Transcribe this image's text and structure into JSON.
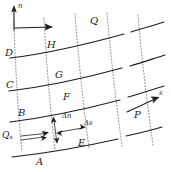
{
  "figure": {
    "type": "hand-drawn-diagram",
    "background_color": "#ffffff",
    "ink_color": "#1f1f1f",
    "dotted_line_color": "#6e6e6e"
  },
  "axes": {
    "normal_axis_label": "n",
    "streamwise_axis_label": "s"
  },
  "nodes": {
    "a": "A",
    "b": "B",
    "c": "C",
    "d": "D",
    "e": "E",
    "f": "F",
    "g": "G",
    "h": "H",
    "p": "P",
    "q": "Q"
  },
  "annotations": {
    "delta_n": "Δn",
    "delta_s": "Δs",
    "flux_symbol": "Q",
    "flux_subscript": "s"
  },
  "counts": {
    "streamlines": "4",
    "normal_lines": "5"
  }
}
